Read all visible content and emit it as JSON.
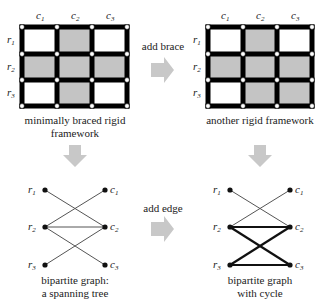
{
  "title_fragment": "g",
  "colors": {
    "frame": "#000000",
    "shaded_cell": "#c4c4c4",
    "joint": "#ffffff",
    "arrow": "#c8c8c8",
    "thin_edge": "#555555",
    "bold_edge": "#111111",
    "text": "#222222"
  },
  "top_left": {
    "caption_line1": "minimally braced rigid",
    "caption_line2": "framework",
    "col_labels": [
      "c",
      "c",
      "c"
    ],
    "col_subs": [
      "1",
      "2",
      "3"
    ],
    "row_labels": [
      "r",
      "r",
      "r"
    ],
    "row_subs": [
      "1",
      "2",
      "3"
    ],
    "shaded_cells": [
      [
        0,
        1
      ],
      [
        1,
        0
      ],
      [
        1,
        1
      ],
      [
        1,
        2
      ],
      [
        2,
        1
      ]
    ]
  },
  "top_right": {
    "caption": "another rigid framework",
    "col_labels": [
      "c",
      "c",
      "c"
    ],
    "col_subs": [
      "1",
      "2",
      "3"
    ],
    "row_labels": [
      "r",
      "r",
      "r"
    ],
    "row_subs": [
      "1",
      "2",
      "3"
    ],
    "shaded_cells": [
      [
        0,
        1
      ],
      [
        1,
        0
      ],
      [
        1,
        1
      ],
      [
        1,
        2
      ],
      [
        2,
        1
      ],
      [
        2,
        2
      ]
    ]
  },
  "arrow_top": {
    "label": "add brace"
  },
  "arrow_bottom": {
    "label": "add edge"
  },
  "bottom_left": {
    "caption_line1": "bipartite graph:",
    "caption_line2": "a spanning tree",
    "row_nodes": [
      "r1",
      "r2",
      "r3"
    ],
    "col_nodes": [
      "c1",
      "c2",
      "c3"
    ],
    "edges": [
      [
        "r1",
        "c2"
      ],
      [
        "r2",
        "c1"
      ],
      [
        "r2",
        "c2"
      ],
      [
        "r2",
        "c3"
      ],
      [
        "r3",
        "c2"
      ]
    ]
  },
  "bottom_right": {
    "caption_line1": "bipartite graph",
    "caption_line2": "with cycle",
    "row_nodes": [
      "r1",
      "r2",
      "r3"
    ],
    "col_nodes": [
      "c1",
      "c2",
      "c3"
    ],
    "edges": [
      [
        "r1",
        "c2"
      ],
      [
        "r2",
        "c1"
      ],
      [
        "r2",
        "c2"
      ],
      [
        "r2",
        "c3"
      ],
      [
        "r3",
        "c2"
      ],
      [
        "r3",
        "c3"
      ]
    ],
    "bold_edges": [
      [
        "r2",
        "c2"
      ],
      [
        "r2",
        "c3"
      ],
      [
        "r3",
        "c2"
      ],
      [
        "r3",
        "c3"
      ]
    ]
  }
}
